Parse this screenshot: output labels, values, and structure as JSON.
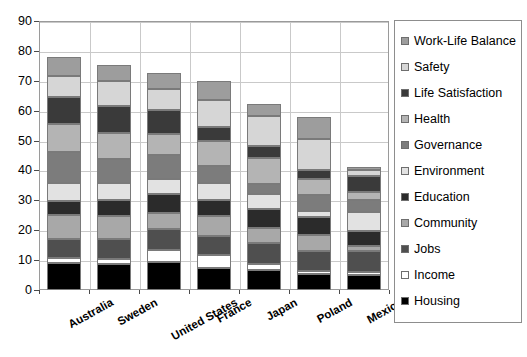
{
  "chart_data": {
    "type": "bar",
    "stacked": true,
    "title": "",
    "xlabel": "",
    "ylabel": "",
    "ylim": [
      0,
      90
    ],
    "ytick_step": 10,
    "grid": true,
    "legend_position": "right",
    "categories": [
      "Australia",
      "Sweden",
      "United States",
      "France",
      "Japan",
      "Poland",
      "Mexico"
    ],
    "yticks": [
      "0",
      "10",
      "20",
      "30",
      "40",
      "50",
      "60",
      "70",
      "80",
      "90"
    ],
    "series": [
      {
        "name": "Housing",
        "color": "#000000",
        "values": [
          9.0,
          8.8,
          9.3,
          7.2,
          6.6,
          5.2,
          5.0
        ]
      },
      {
        "name": "Income",
        "color": "#ffffff",
        "values": [
          1.6,
          1.5,
          4.0,
          4.4,
          2.2,
          1.3,
          0.9
        ]
      },
      {
        "name": "Jobs",
        "color": "#4f4f4f",
        "values": [
          6.5,
          6.8,
          7.2,
          6.6,
          6.9,
          6.4,
          7.2
        ]
      },
      {
        "name": "Community",
        "color": "#a8a8a8",
        "values": [
          8.0,
          7.6,
          5.4,
          6.5,
          5.2,
          5.6,
          1.7
        ]
      },
      {
        "name": "Education",
        "color": "#2b2b2b",
        "values": [
          4.6,
          5.4,
          6.2,
          5.4,
          6.3,
          5.9,
          5.0
        ]
      },
      {
        "name": "Environment",
        "color": "#e2e2e2",
        "values": [
          6.0,
          5.6,
          5.2,
          5.6,
          5.0,
          2.0,
          6.2
        ]
      },
      {
        "name": "Governance",
        "color": "#7c7c7c",
        "values": [
          10.4,
          8.3,
          7.8,
          5.9,
          3.2,
          5.4,
          4.2
        ]
      },
      {
        "name": "Health",
        "color": "#b4b4b4",
        "values": [
          9.5,
          8.5,
          7.0,
          8.4,
          8.7,
          5.2,
          2.6
        ]
      },
      {
        "name": "Life Satisfaction",
        "color": "#3a3a3a",
        "values": [
          9.0,
          9.2,
          8.0,
          4.6,
          4.1,
          3.0,
          5.5
        ]
      },
      {
        "name": "Safety",
        "color": "#d6d6d6",
        "values": [
          7.1,
          8.3,
          7.0,
          9.0,
          9.9,
          10.4,
          2.0
        ]
      },
      {
        "name": "Work-Life Balance",
        "color": "#9d9d9d",
        "values": [
          6.2,
          5.4,
          5.5,
          6.5,
          4.0,
          7.6,
          0.9
        ]
      }
    ],
    "totals": [
      89.0,
      88.1,
      83.0,
      76.0,
      67.0,
      59.0,
      41.0
    ]
  },
  "legend": {
    "items": [
      {
        "label": "Work-Life Balance",
        "color": "#9d9d9d"
      },
      {
        "label": "Safety",
        "color": "#d6d6d6"
      },
      {
        "label": "Life Satisfaction",
        "color": "#3a3a3a"
      },
      {
        "label": "Health",
        "color": "#b4b4b4"
      },
      {
        "label": "Governance",
        "color": "#7c7c7c"
      },
      {
        "label": "Environment",
        "color": "#e2e2e2"
      },
      {
        "label": "Education",
        "color": "#2b2b2b"
      },
      {
        "label": "Community",
        "color": "#a8a8a8"
      },
      {
        "label": "Jobs",
        "color": "#4f4f4f"
      },
      {
        "label": "Income",
        "color": "#ffffff"
      },
      {
        "label": "Housing",
        "color": "#000000"
      }
    ]
  }
}
